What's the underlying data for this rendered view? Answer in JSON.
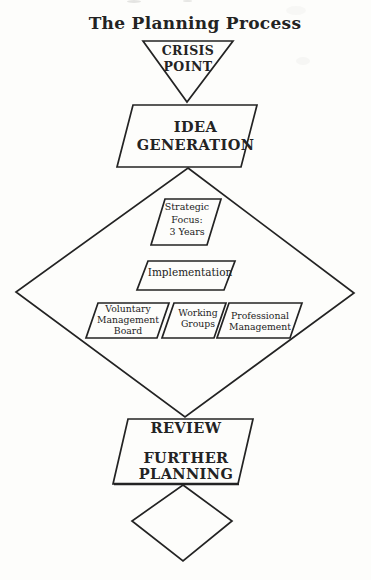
{
  "colors": {
    "ink": "#232323",
    "paper": "#fdfdfb"
  },
  "title": "The Planning Process",
  "nodes": {
    "crisis": {
      "shape": "inverted-triangle",
      "line1": "CRISIS",
      "line2": "POINT"
    },
    "idea": {
      "shape": "parallelogram",
      "line1": "IDEA",
      "line2": "GENERATION"
    },
    "strategic_focus": {
      "shape": "parallelogram",
      "line1": "Strategic",
      "line2": "Focus:",
      "line3": "3 Years"
    },
    "implementation": {
      "shape": "parallelogram",
      "label": "Implementation"
    },
    "voluntary_management_board": {
      "shape": "parallelogram",
      "line1": "Voluntary",
      "line2": "Management",
      "line3": "Board"
    },
    "working_groups": {
      "shape": "parallelogram",
      "line1": "Working",
      "line2": "Groups"
    },
    "professional_management": {
      "shape": "parallelogram",
      "line1": "Professional",
      "line2": "Management"
    },
    "review_further_planning": {
      "shape": "parallelogram",
      "line1": "REVIEW",
      "line2": "FURTHER",
      "line3": "PLANNING"
    },
    "strategy_diamond": {
      "shape": "diamond",
      "label": ""
    },
    "end_diamond": {
      "shape": "diamond",
      "label": ""
    }
  }
}
